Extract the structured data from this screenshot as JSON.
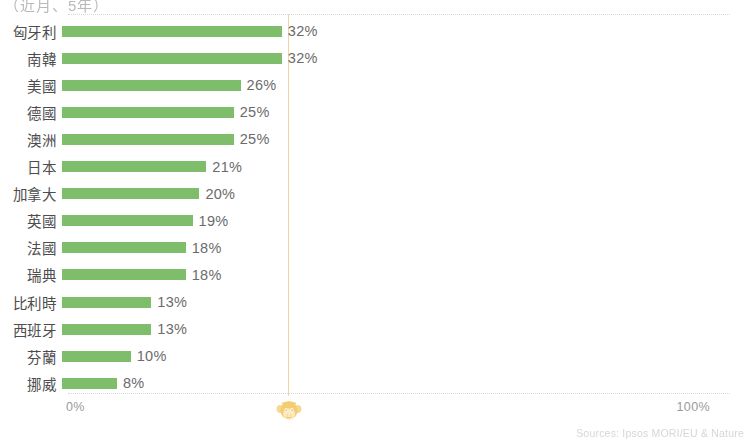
{
  "title_clipped": "（近月、5年）",
  "axis": {
    "left_label": "0%",
    "right_label": "100%"
  },
  "source_note": "Sources: Ipsos MORI/EU & Nature",
  "watermark": {
    "name": "monkey-face-watermark",
    "color": "#f3c55a"
  },
  "colors": {
    "bar": "#7ebe6b",
    "gridline": "#f0cf9a",
    "axis_text": "#9a9a9a",
    "label_text": "#4d4d4d",
    "value_text": "#6b6b6b",
    "plot_border": "#ded9d0"
  },
  "chart_data": {
    "type": "bar",
    "orientation": "horizontal",
    "title": "（近月、5年）",
    "xlabel": "",
    "ylabel": "",
    "xlim": [
      0,
      100
    ],
    "grid": true,
    "legend": false,
    "unit": "%",
    "categories": [
      "匈牙利",
      "南韓",
      "美國",
      "德國",
      "澳洲",
      "日本",
      "加拿大",
      "英國",
      "法國",
      "瑞典",
      "比利時",
      "西班牙",
      "芬蘭",
      "挪威"
    ],
    "values": [
      32,
      32,
      26,
      25,
      25,
      21,
      20,
      19,
      18,
      18,
      13,
      13,
      10,
      8
    ],
    "value_labels": [
      "32%",
      "32%",
      "26%",
      "25%",
      "25%",
      "21%",
      "20%",
      "19%",
      "18%",
      "18%",
      "13%",
      "13%",
      "10%",
      "8%"
    ],
    "tick_labels": [
      "0%",
      "100%"
    ],
    "series": [
      {
        "name": "percentage",
        "values": [
          32,
          32,
          26,
          25,
          25,
          21,
          20,
          19,
          18,
          18,
          13,
          13,
          10,
          8
        ]
      }
    ]
  }
}
